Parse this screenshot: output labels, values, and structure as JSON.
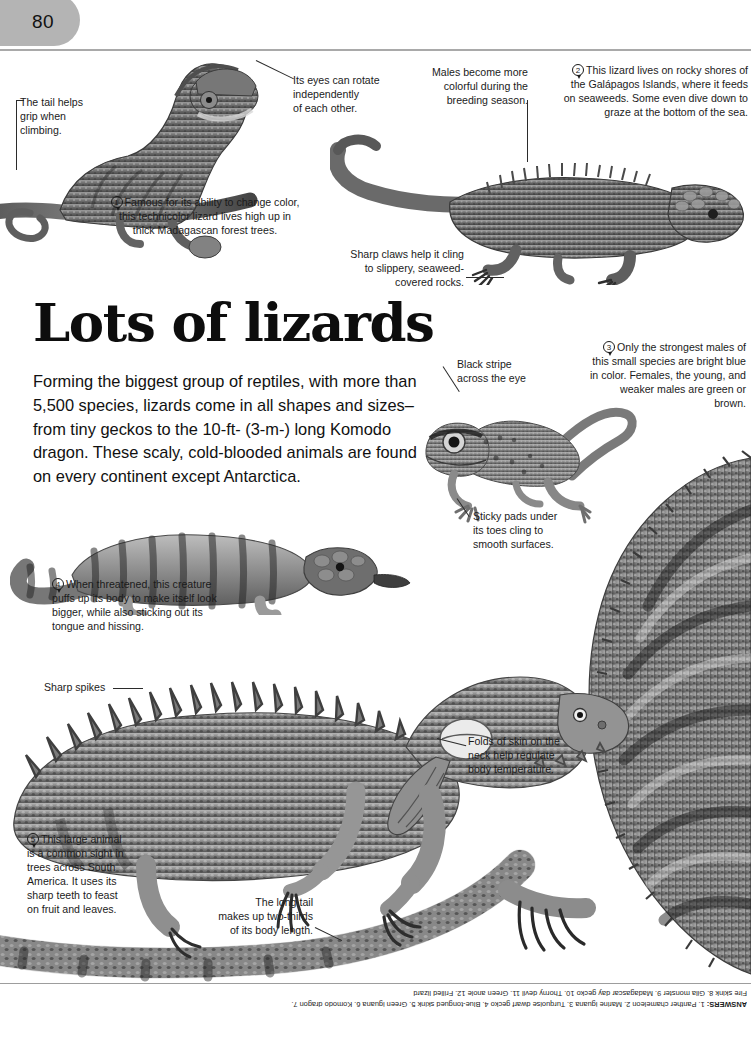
{
  "page": {
    "number": "80",
    "title": "Lots of lizards",
    "intro": "Forming the biggest group of reptiles, with more than 5,500 species, lizards come in all shapes and sizes–from tiny geckos to the 10-ft- (3-m-) long Komodo dragon. These scaly, cold-blooded animals are found on every continent except Antarctica."
  },
  "callouts": {
    "tail_grip": "The tail helps\ngrip when\nclimbing.",
    "eyes_rotate": "Its eyes can rotate\nindependently\nof each other.",
    "males_colorful": "Males become more\ncolorful during the\nbreeding season.",
    "sharp_claws": "Sharp claws help it cling\nto slippery, seaweed-\ncovered rocks.",
    "black_stripe": "Black stripe\nacross the eye",
    "sticky_pads": "Sticky pads under\nits toes cling to\nsmooth surfaces.",
    "sharp_spikes": "Sharp spikes",
    "folds_of_skin": "Folds of skin on the\nneck help regulate\nbody temperature.",
    "long_tail": "The long tail\nmakes up two-thirds\nof its body length."
  },
  "numbered": {
    "one": {
      "number": "1",
      "text": "Famous for its ability to change color, this technicolor lizard lives high up in thick Madagascan forest trees."
    },
    "two": {
      "number": "2",
      "text": "This lizard lives on rocky shores of the Galápagos Islands, where it feeds on seaweeds. Some even dive down to graze at the bottom of the sea."
    },
    "three": {
      "number": "3",
      "text": "Only the strongest males of this small species are bright blue in color. Females, the young, and weaker males are green or brown."
    },
    "four": {
      "number": "4",
      "text": "When threatened, this creature puffs up its body to make itself look bigger, while also sticking out its tongue and hissing."
    },
    "five": {
      "number": "5",
      "text": "This large animal is a common sight in trees across South America. It uses its sharp teeth to feast on fruit and leaves."
    }
  },
  "answers": {
    "label": "ANSWERS:",
    "text": " 1. Panther chameleon 2. Marine iguana 3. Turquoise dwarf gecko 4. Blue-tongued skink 5. Green iguana 6. Komodo dragon 7. Fire skink 8. Gila monster 9. Madagascar day gecko 10. Thorny devil 11. Green anole 12. Frilled lizard"
  },
  "photos": {
    "chameleon": "panther-chameleon-photo",
    "marine_iguana": "marine-iguana-photo",
    "gecko": "turquoise-dwarf-gecko-photo",
    "skink": "blue-tongued-skink-photo",
    "green_iguana": "green-iguana-photo",
    "frilled": "frilled-lizard-photo"
  },
  "colors": {
    "tab": "#b4b4b4",
    "rule": "#a9a9a9",
    "text": "#1a1a1a"
  }
}
